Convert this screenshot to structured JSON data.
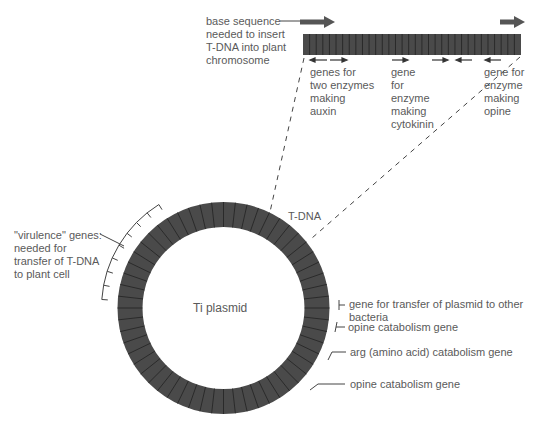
{
  "diagram": {
    "plasmid_label": "Ti plasmid",
    "tdna_label": "T-DNA",
    "colors": {
      "ring": "#4a4a4a",
      "segment_line": "#222222",
      "text": "#5a5a5a",
      "line": "#444444",
      "arrow": "#555555"
    },
    "tdna_bar": {
      "insert_label": [
        "base sequence",
        "needed to insert",
        "T-DNA into plant",
        "chromosome"
      ],
      "genes": [
        {
          "lines": [
            "genes for",
            "two enzymes",
            "making",
            "auxin"
          ]
        },
        {
          "lines": [
            "gene",
            "for",
            "enzyme",
            "making",
            "cytokinin"
          ]
        },
        {
          "lines": [
            "gene for",
            "enzyme",
            "making",
            "opine"
          ]
        }
      ]
    },
    "virulence_label": [
      "\"virulence\" genes:",
      "needed for",
      "transfer of T-DNA",
      "to plant cell"
    ],
    "right_labels": [
      {
        "lines": [
          "gene for transfer of plasmid to other",
          "bacteria"
        ]
      },
      {
        "lines": [
          "opine catabolism gene"
        ]
      },
      {
        "lines": [
          "arg (amino acid) catabolism gene"
        ]
      },
      {
        "lines": [
          "opine catabolism gene"
        ]
      }
    ]
  }
}
